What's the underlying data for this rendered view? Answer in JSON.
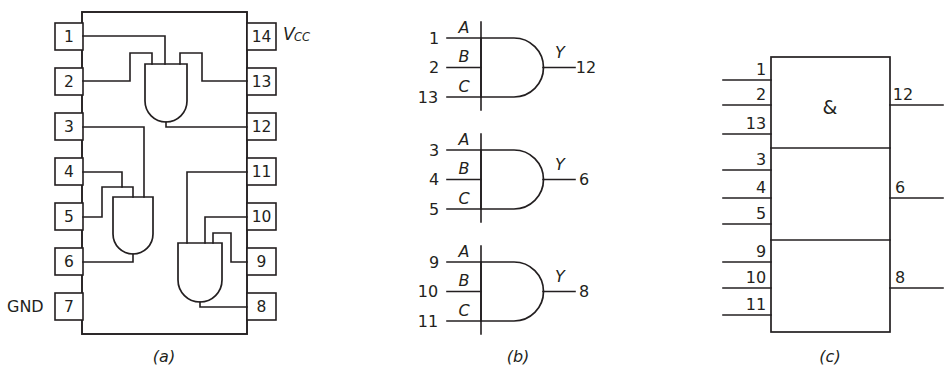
{
  "figure": {
    "ink_color": "#231f20",
    "background_color": "#ffffff"
  },
  "panel_a": {
    "caption": "(a)",
    "power_label": "V",
    "power_label_sub": "CC",
    "ground_label": "GND",
    "left_pins": [
      {
        "number": "1"
      },
      {
        "number": "2"
      },
      {
        "number": "3"
      },
      {
        "number": "4"
      },
      {
        "number": "5"
      },
      {
        "number": "6"
      },
      {
        "number": "7"
      }
    ],
    "right_pins": [
      {
        "number": "14"
      },
      {
        "number": "13"
      },
      {
        "number": "12"
      },
      {
        "number": "11"
      },
      {
        "number": "10"
      },
      {
        "number": "9"
      },
      {
        "number": "8"
      }
    ]
  },
  "panel_b": {
    "caption": "(b)",
    "gates": [
      {
        "inputs": [
          {
            "pin": "1",
            "letter": "A"
          },
          {
            "pin": "2",
            "letter": "B"
          },
          {
            "pin": "13",
            "letter": "C"
          }
        ],
        "output": {
          "pin": "12",
          "letter": "Y"
        }
      },
      {
        "inputs": [
          {
            "pin": "3",
            "letter": "A"
          },
          {
            "pin": "4",
            "letter": "B"
          },
          {
            "pin": "5",
            "letter": "C"
          }
        ],
        "output": {
          "pin": "6",
          "letter": "Y"
        }
      },
      {
        "inputs": [
          {
            "pin": "9",
            "letter": "A"
          },
          {
            "pin": "10",
            "letter": "B"
          },
          {
            "pin": "11",
            "letter": "C"
          }
        ],
        "output": {
          "pin": "8",
          "letter": "Y"
        }
      }
    ]
  },
  "panel_c": {
    "caption": "(c)",
    "qualifying_symbol": "&",
    "sections": [
      {
        "inputs": [
          "1",
          "2",
          "13"
        ],
        "output": "12"
      },
      {
        "inputs": [
          "3",
          "4",
          "5"
        ],
        "output": "6"
      },
      {
        "inputs": [
          "9",
          "10",
          "11"
        ],
        "output": "8"
      }
    ]
  }
}
